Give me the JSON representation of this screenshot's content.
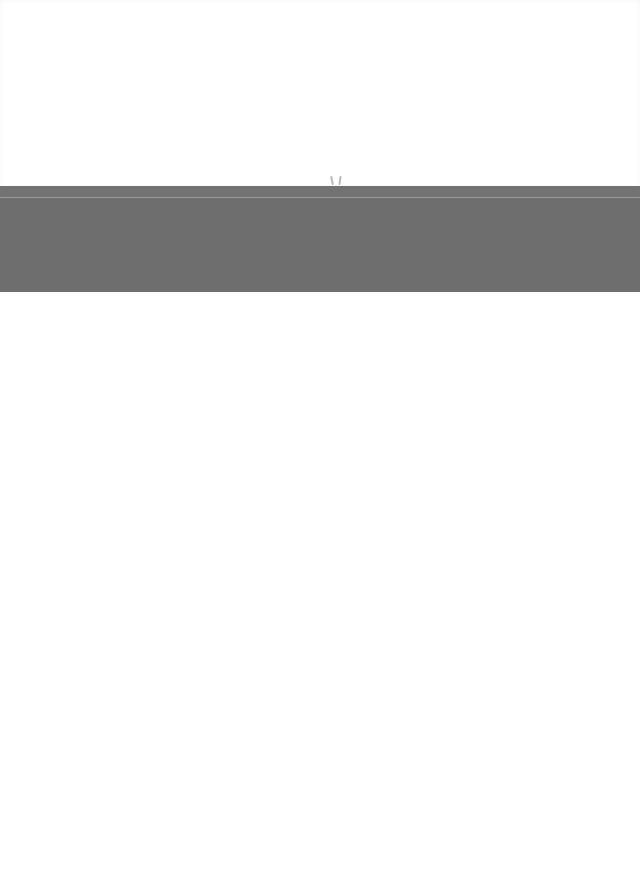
{
  "page": {
    "background_color": "#ffffff"
  },
  "banner": {
    "color": "#6f6f6f",
    "divider_color": "#9a9a9a",
    "text": ""
  },
  "content": {
    "text": ""
  }
}
